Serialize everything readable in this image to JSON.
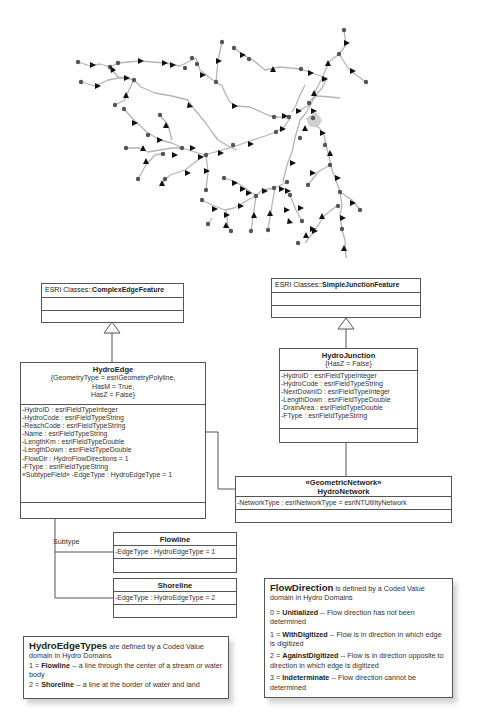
{
  "map": {
    "description": "Stream network with edges (flow direction arrows) and junction points",
    "edge_color": "#b0b0b0",
    "junction_color": "#555555",
    "arrow_color": "#111111"
  },
  "complex_edge_feature": {
    "prefix": "ESRI Classes::",
    "name": "ComplexEdgeFeature"
  },
  "simple_junction_feature": {
    "prefix": "ESRI Classes::",
    "name": "SimpleJunctionFeature"
  },
  "hydro_edge": {
    "name": "HydroEdge",
    "tags": [
      "{GeometryType = esriGeometryPolyline,",
      "HasM = True,",
      "HasZ = False}"
    ],
    "attributes": [
      "-HydroID : esriFieldTypeInteger",
      "-HydroCode : esriFieldTypeString",
      "-ReachCode : esriFieldTypeString",
      "-Name : esriFieldTypeString",
      "-LengthKm : esriFieldTypeDouble",
      "-LengthDown : esriFieldTypeDouble",
      "-FlowDir : HydroFlowDirections = 1",
      "-FType : esriFieldTypeString",
      "«SubtypeField» -EdgeType : HydroEdgeType = 1"
    ]
  },
  "hydro_junction": {
    "name": "HydroJunction",
    "tags": [
      "{HasZ = False}"
    ],
    "attributes": [
      "-HydroID : esriFieldTypeInteger",
      "-HydroCode : esriFieldTypeString",
      "-NextDownID : esriFieldTypeInteger",
      "-LengthDown : esriFieldTypeDouble",
      "-DrainArea : esriFieldTypeDouble",
      "-FType : esriFieldTypeString"
    ]
  },
  "hydro_network": {
    "stereotype": "«GeometricNetwork»",
    "name": "HydroNetwork",
    "attributes": [
      "-NetworkType : esriNetworkType = esriNTUtilityNetwork"
    ]
  },
  "subtype_label": "Subtype",
  "flowline": {
    "name": "Flowline",
    "attributes": [
      "-EdgeType : HydroEdgeType = 1"
    ]
  },
  "shoreline": {
    "name": "Shoreline",
    "attributes": [
      "-EdgeType : HydroEdgeType = 2"
    ]
  },
  "edge_types_note": {
    "heading": "HydroEdgeTypes",
    "heading_rest": " are defined by a Coded Value domain in Hydro Domains",
    "items": [
      {
        "code": "1 = ",
        "name": "Flowline",
        "desc": " -- a line through the center of a stream or water body"
      },
      {
        "code": "2 = ",
        "name": "Shoreline",
        "desc": " -- a line at the border of water and land"
      }
    ]
  },
  "flow_direction_note": {
    "heading": "FlowDirection",
    "heading_rest": " is defined by a Coded Value domain in Hydro Domains",
    "items": [
      {
        "code": "0 = ",
        "name": "Unitialized",
        "desc": " -- Flow direction has not been determined"
      },
      {
        "code": "1 = ",
        "name": "WithDigitized",
        "desc": " -- Flow is in direction in which edge is digitized"
      },
      {
        "code": "2 = ",
        "name": "AgainstDigitized",
        "desc": " -- Flow is in direction opposite to direction in which edge is digitized"
      },
      {
        "code": "3 = ",
        "name": "Indeterminate",
        "desc": " -- Flow direction cannot be determined"
      }
    ]
  }
}
